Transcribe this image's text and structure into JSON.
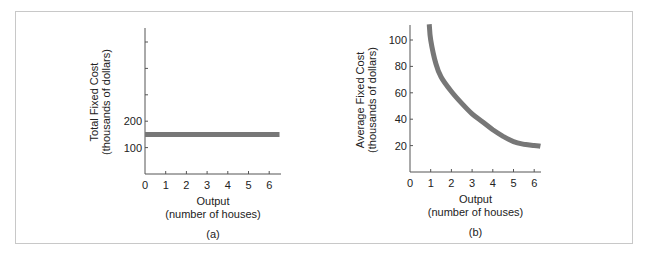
{
  "chart_data": [
    {
      "id": "a",
      "type": "line",
      "panel_label": "(a)",
      "title": "",
      "xlabel": "Output",
      "xlabel_sub": "(number of houses)",
      "ylabel": "Total Fixed Cost",
      "ylabel_sub": "(thousands of dollars)",
      "x_ticks": [
        0,
        1,
        2,
        3,
        4,
        5,
        6
      ],
      "y_ticks_labeled": [
        100,
        200
      ],
      "y_ticks_unlabeled": [
        300,
        400,
        500
      ],
      "xlim": [
        0,
        6.5
      ],
      "ylim": [
        0,
        550
      ],
      "grid": false,
      "series": [
        {
          "name": "Total Fixed Cost",
          "x": [
            0,
            6.5
          ],
          "y": [
            150,
            150
          ],
          "color": "#777777"
        }
      ]
    },
    {
      "id": "b",
      "type": "line",
      "panel_label": "(b)",
      "title": "",
      "xlabel": "Output",
      "xlabel_sub": "(number of houses)",
      "ylabel": "Average Fixed Cost",
      "ylabel_sub": "(thousands of dollars)",
      "x_ticks": [
        0,
        1,
        2,
        3,
        4,
        5,
        6
      ],
      "y_ticks_labeled": [
        20,
        40,
        60,
        80,
        100
      ],
      "xlim": [
        0,
        6.5
      ],
      "ylim": [
        0,
        112
      ],
      "grid": false,
      "series": [
        {
          "name": "Average Fixed Cost",
          "x": [
            0.93,
            1.0,
            1.25,
            1.5,
            2.0,
            2.5,
            3.0,
            3.5,
            4.0,
            4.5,
            5.0,
            5.5,
            6.0,
            6.3
          ],
          "y": [
            112,
            100,
            82,
            72,
            61,
            52,
            44,
            38,
            32,
            27,
            23,
            21,
            20,
            19.5
          ],
          "color": "#777777"
        }
      ]
    }
  ]
}
